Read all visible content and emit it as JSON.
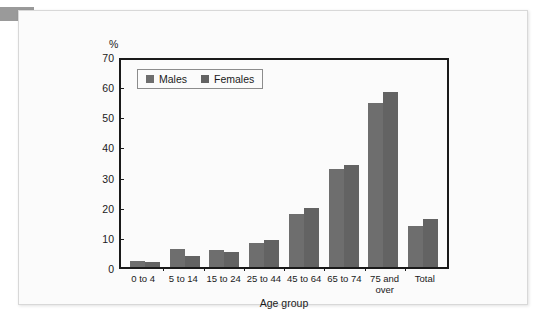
{
  "chart_data": {
    "type": "bar",
    "title": "",
    "xlabel": "Age group",
    "ylabel": "%",
    "ylim": [
      0,
      70
    ],
    "yticks": [
      0,
      10,
      20,
      30,
      40,
      50,
      60,
      70
    ],
    "grid": false,
    "legend_position": "top-left-inside",
    "categories": [
      "0 to 4",
      "5 to 14",
      "15 to 24",
      "25 to 44",
      "45 to 64",
      "65 to 74",
      "75 and over",
      "Total"
    ],
    "series": [
      {
        "name": "Males",
        "color": "#6e6e6e",
        "values": [
          2.0,
          6.0,
          5.5,
          8.0,
          17.5,
          32.5,
          54.5,
          13.5
        ]
      },
      {
        "name": "Females",
        "color": "#636363",
        "values": [
          1.5,
          3.5,
          5.0,
          9.0,
          19.5,
          34.0,
          58.0,
          16.0
        ]
      }
    ]
  }
}
